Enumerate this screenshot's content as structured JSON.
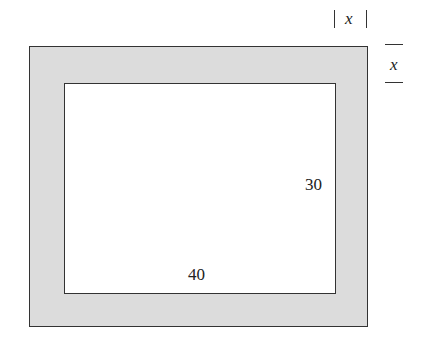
{
  "diagram": {
    "inner_width_label": "40",
    "inner_height_label": "30",
    "border_width_label_top": "x",
    "border_width_label_right": "x",
    "colors": {
      "border_fill": "#dcdcdc",
      "inner_fill": "#ffffff",
      "stroke": "#333333"
    }
  }
}
